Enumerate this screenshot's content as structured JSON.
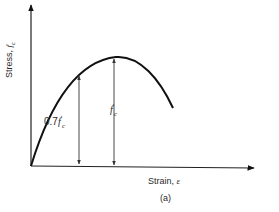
{
  "figure": {
    "caption": "(a)",
    "x_axis_label": "Strain, ",
    "x_axis_symbol": "ε",
    "y_axis_label": "Stress, ",
    "y_axis_symbol": "f",
    "y_axis_subscript": "c"
  },
  "annotations": {
    "partial_stress": {
      "prefix": "0.7",
      "symbol": "f",
      "prime": "′",
      "subscript": "c"
    },
    "peak_stress": {
      "symbol": "f",
      "prime": "′",
      "subscript": "c"
    }
  },
  "colors": {
    "line": "#111111",
    "dim": "#333333"
  }
}
